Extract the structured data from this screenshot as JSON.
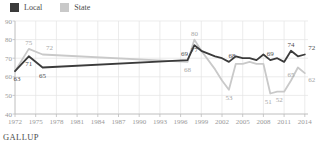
{
  "legend": {
    "items": [
      {
        "label": "Local",
        "swatch": "local-swatch"
      },
      {
        "label": "State",
        "swatch": "state-swatch"
      }
    ]
  },
  "footer": {
    "source": "GALLUP"
  },
  "chart_data": {
    "type": "line",
    "title": "",
    "xlabel": "",
    "ylabel": "",
    "x_ticks": [
      1972,
      1975,
      1978,
      1981,
      1984,
      1987,
      1990,
      1993,
      1996,
      1999,
      2002,
      2005,
      2008,
      2011,
      2014
    ],
    "y_ticks": [
      40,
      50,
      60,
      70,
      80,
      90
    ],
    "xlim": [
      1972,
      2014
    ],
    "ylim": [
      40,
      90
    ],
    "grid": true,
    "legend_position": "top-left",
    "colors": {
      "grid": "#e4e4e4",
      "axis": "#bcbcbc",
      "tick_label": "#999999",
      "background": "#ffffff"
    },
    "series": [
      {
        "name": "Local",
        "color": "#3b3b3b",
        "label_color": "#4d4d4d",
        "points": [
          [
            1972,
            63
          ],
          [
            1974,
            71
          ],
          [
            1976,
            65
          ],
          [
            1997,
            69
          ],
          [
            1998,
            77
          ],
          [
            1999,
            74
          ],
          [
            2001,
            71
          ],
          [
            2002,
            70
          ],
          [
            2003,
            68
          ],
          [
            2004,
            71
          ],
          [
            2005,
            70
          ],
          [
            2006,
            70
          ],
          [
            2007,
            69
          ],
          [
            2008,
            72
          ],
          [
            2009,
            69
          ],
          [
            2010,
            70
          ],
          [
            2011,
            68
          ],
          [
            2012,
            74
          ],
          [
            2013,
            71
          ],
          [
            2014,
            72
          ]
        ],
        "point_labels": [
          {
            "year": 1972,
            "value": 63,
            "pos": "below",
            "dx": 2
          },
          {
            "year": 1974,
            "value": 71,
            "pos": "below"
          },
          {
            "year": 1976,
            "value": 65,
            "pos": "below"
          },
          {
            "year": 1997,
            "value": 69,
            "pos": "above",
            "dx": -3
          },
          {
            "year": 1998,
            "value": 77,
            "pos": "below",
            "dy": -3
          },
          {
            "year": 2003,
            "value": 68,
            "pos": "above",
            "dx": 3
          },
          {
            "year": 2009,
            "value": 69,
            "pos": "above"
          },
          {
            "year": 2012,
            "value": 74,
            "pos": "above"
          },
          {
            "year": 2014,
            "value": 72,
            "pos": "above-right"
          }
        ]
      },
      {
        "name": "State",
        "color": "#c9c9c9",
        "label_color": "#a6a6a6",
        "points": [
          [
            1972,
            63
          ],
          [
            1974,
            75
          ],
          [
            1976,
            72
          ],
          [
            1997,
            68
          ],
          [
            1998,
            80
          ],
          [
            1999,
            74
          ],
          [
            2001,
            64
          ],
          [
            2002,
            58
          ],
          [
            2003,
            53
          ],
          [
            2004,
            67
          ],
          [
            2005,
            67
          ],
          [
            2006,
            68
          ],
          [
            2007,
            67
          ],
          [
            2008,
            67
          ],
          [
            2009,
            51
          ],
          [
            2010,
            52
          ],
          [
            2011,
            52
          ],
          [
            2012,
            58
          ],
          [
            2013,
            65
          ],
          [
            2014,
            62
          ]
        ],
        "point_labels": [
          {
            "year": 1974,
            "value": 75,
            "pos": "above"
          },
          {
            "year": 1976,
            "value": 72,
            "pos": "above-right"
          },
          {
            "year": 1997,
            "value": 68,
            "pos": "below"
          },
          {
            "year": 1998,
            "value": 80,
            "pos": "above"
          },
          {
            "year": 2003,
            "value": 53,
            "pos": "below"
          },
          {
            "year": 2009,
            "value": 51,
            "pos": "below",
            "dx": -2
          },
          {
            "year": 2010,
            "value": 52,
            "pos": "below",
            "dx": 2
          },
          {
            "year": 2013,
            "value": 65,
            "pos": "below-left"
          },
          {
            "year": 2014,
            "value": 62,
            "pos": "below-right"
          }
        ]
      }
    ]
  }
}
